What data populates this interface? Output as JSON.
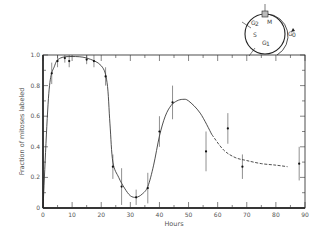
{
  "chart_data": {
    "type": "scatter",
    "title": "",
    "xlabel": "Hours",
    "ylabel": "Fraction of mitoses labeled",
    "xlim": [
      0,
      90
    ],
    "ylim": [
      0,
      1.0
    ],
    "x_ticks": [
      "0",
      "10",
      "20",
      "30",
      "40",
      "50",
      "60",
      "70",
      "80",
      "90"
    ],
    "y_ticks": [
      "0",
      "0.2",
      "0.4",
      "0.6",
      "0.8",
      "1.0"
    ],
    "grid": false,
    "series": [
      {
        "name": "Measured fraction labeled",
        "style": "points with error bars",
        "x": [
          3,
          5,
          7.5,
          9,
          15,
          17.5,
          21.5,
          24,
          27,
          32,
          36,
          40,
          44.5,
          56,
          63.5,
          68.5,
          88
        ],
        "y": [
          0.88,
          0.96,
          0.98,
          0.96,
          0.97,
          0.96,
          0.86,
          0.27,
          0.14,
          0.07,
          0.13,
          0.5,
          0.69,
          0.37,
          0.52,
          0.27,
          0.29
        ],
        "err": [
          0.07,
          0.04,
          0.03,
          0.04,
          0.03,
          0.04,
          0.06,
          0.08,
          0.12,
          0.05,
          0.1,
          0.1,
          0.11,
          0.13,
          0.1,
          0.08,
          0.11
        ]
      },
      {
        "name": "Fitted curve",
        "style": "solid then dashed (after ~58 h)",
        "x": [
          0,
          2,
          4,
          6,
          10,
          15,
          20,
          22,
          23,
          24,
          26,
          28,
          30,
          32,
          34,
          36,
          38,
          40,
          42,
          44,
          46,
          48,
          50,
          54,
          58,
          62,
          66,
          70,
          75,
          80,
          84
        ],
        "y": [
          0,
          0.75,
          0.93,
          0.98,
          0.99,
          0.98,
          0.93,
          0.82,
          0.55,
          0.3,
          0.2,
          0.13,
          0.08,
          0.07,
          0.09,
          0.14,
          0.28,
          0.47,
          0.6,
          0.67,
          0.7,
          0.71,
          0.7,
          0.62,
          0.48,
          0.38,
          0.33,
          0.31,
          0.29,
          0.28,
          0.27
        ]
      }
    ],
    "annotations": [
      "Cell cycle diagram: M, G2, S, G1, G0"
    ]
  },
  "inset": {
    "labels": {
      "m": "M",
      "g2": "G",
      "g2_sub": "2",
      "s": "S",
      "g1": "G",
      "g1_sub": "1",
      "g0": "G",
      "g0_sub": "0"
    }
  }
}
